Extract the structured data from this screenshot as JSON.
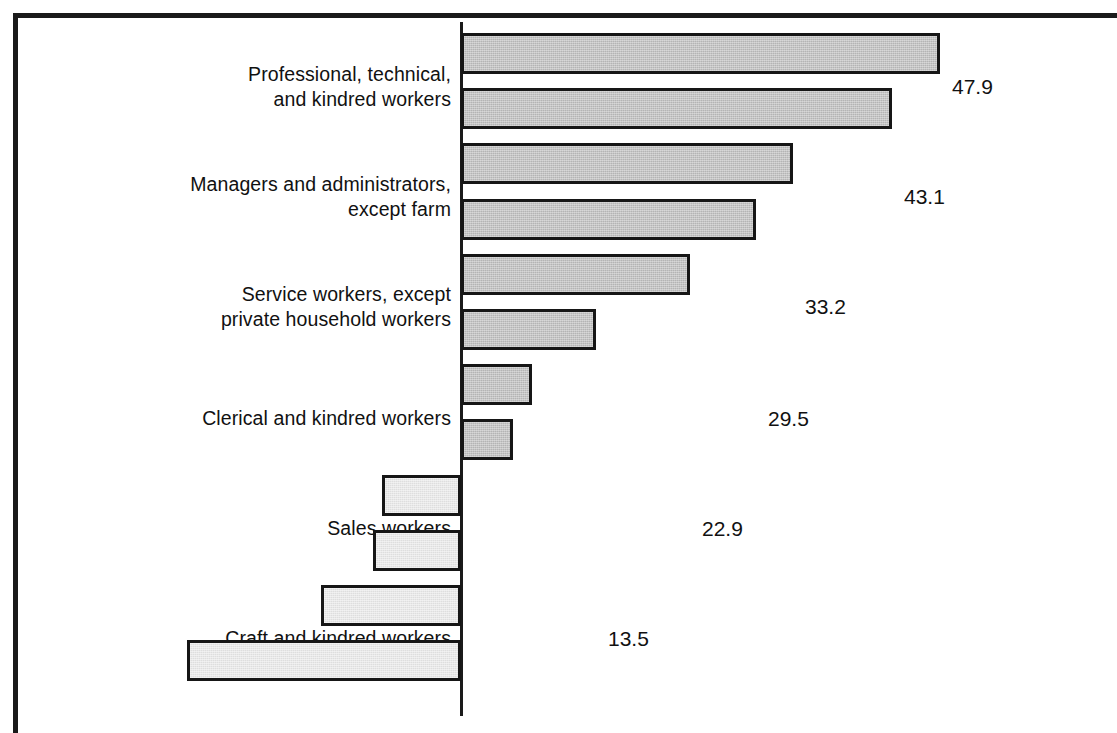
{
  "chart_data": {
    "type": "bar",
    "orientation": "horizontal",
    "title": "",
    "subtitle": "",
    "xlabel": "",
    "ylabel": "",
    "xlim": [
      -30,
      50
    ],
    "grid": false,
    "legend": null,
    "zero_line": 0,
    "categories": [
      "Professional, technical,\nand kindred workers",
      "Managers and administrators,\nexcept farm",
      "Service workers, except\nprivate household workers",
      "Clerical and kindred workers",
      "Sales workers",
      "Craft and kindred workers",
      "Laborers, except farm",
      "Transport equipment operators",
      "Farm laborers and supervisors",
      "Operators, except transport",
      "Farmers and farm managers",
      "Private household workers"
    ],
    "values": [
      47.9,
      43.1,
      33.2,
      29.5,
      22.9,
      13.5,
      7.1,
      5.2,
      -7.9,
      -8.8,
      -14.0,
      -27.4
    ],
    "value_labels": [
      "47.9",
      "43.1",
      "33.2",
      "29.5",
      "22.9",
      "13.5",
      "7.1",
      "5.2",
      "-7.9",
      "-8.8",
      "-14.0",
      "-27.4"
    ],
    "colors": {
      "positive_fill": "#b4b4b4",
      "negative_fill": "#dedede",
      "bar_outline": "#161616",
      "axis": "#1a1a1a",
      "text": "#111111",
      "background": "#ffffff"
    }
  }
}
